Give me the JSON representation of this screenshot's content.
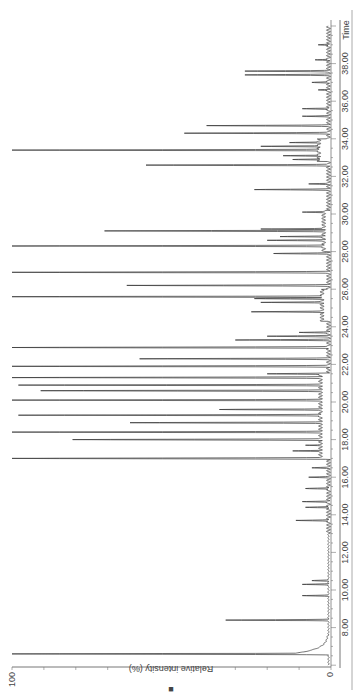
{
  "chart_data": {
    "type": "line",
    "subtype": "chromatogram",
    "orientation": "rotated-90-ccw",
    "title": "",
    "xlabel": "Time",
    "ylabel": "Relative intensity (%)",
    "xlim": [
      6.0,
      40.3
    ],
    "ylim": [
      0,
      100
    ],
    "x_ticks": [
      "8.00",
      "10.00",
      "12.00",
      "14.00",
      "16.00",
      "18.00",
      "20.00",
      "22.00",
      "24.00",
      "26.00",
      "28.00",
      "30.00",
      "32.00",
      "34.00",
      "36.00",
      "38.00"
    ],
    "y_ticks": [
      "0",
      "100"
    ],
    "grid": false,
    "legend": null,
    "marker_symbol": "■",
    "peaks": [
      {
        "t": 6.6,
        "i": 100
      },
      {
        "t": 8.4,
        "i": 33
      },
      {
        "t": 9.7,
        "i": 9
      },
      {
        "t": 10.3,
        "i": 9
      },
      {
        "t": 10.5,
        "i": 6
      },
      {
        "t": 13.7,
        "i": 11
      },
      {
        "t": 14.4,
        "i": 8
      },
      {
        "t": 14.7,
        "i": 9
      },
      {
        "t": 15.4,
        "i": 8
      },
      {
        "t": 16.0,
        "i": 7
      },
      {
        "t": 16.5,
        "i": 6
      },
      {
        "t": 17.0,
        "i": 100
      },
      {
        "t": 17.4,
        "i": 12
      },
      {
        "t": 17.7,
        "i": 8
      },
      {
        "t": 18.0,
        "i": 81
      },
      {
        "t": 18.4,
        "i": 100
      },
      {
        "t": 18.9,
        "i": 63
      },
      {
        "t": 19.3,
        "i": 98
      },
      {
        "t": 19.6,
        "i": 35
      },
      {
        "t": 20.1,
        "i": 100
      },
      {
        "t": 20.6,
        "i": 91
      },
      {
        "t": 20.9,
        "i": 98
      },
      {
        "t": 21.3,
        "i": 100
      },
      {
        "t": 21.5,
        "i": 20
      },
      {
        "t": 21.9,
        "i": 100
      },
      {
        "t": 22.3,
        "i": 60
      },
      {
        "t": 22.9,
        "i": 100
      },
      {
        "t": 23.3,
        "i": 30
      },
      {
        "t": 23.5,
        "i": 20
      },
      {
        "t": 23.7,
        "i": 10
      },
      {
        "t": 24.8,
        "i": 25
      },
      {
        "t": 25.3,
        "i": 22
      },
      {
        "t": 25.5,
        "i": 24
      },
      {
        "t": 25.6,
        "i": 100
      },
      {
        "t": 26.2,
        "i": 64
      },
      {
        "t": 26.9,
        "i": 100
      },
      {
        "t": 27.9,
        "i": 18
      },
      {
        "t": 28.3,
        "i": 100
      },
      {
        "t": 28.6,
        "i": 20
      },
      {
        "t": 28.8,
        "i": 16
      },
      {
        "t": 29.1,
        "i": 71
      },
      {
        "t": 29.2,
        "i": 22
      },
      {
        "t": 30.1,
        "i": 9
      },
      {
        "t": 31.3,
        "i": 24
      },
      {
        "t": 31.6,
        "i": 7
      },
      {
        "t": 32.6,
        "i": 58
      },
      {
        "t": 32.9,
        "i": 12
      },
      {
        "t": 33.1,
        "i": 15
      },
      {
        "t": 33.4,
        "i": 100
      },
      {
        "t": 33.6,
        "i": 22
      },
      {
        "t": 33.8,
        "i": 13
      },
      {
        "t": 34.3,
        "i": 46
      },
      {
        "t": 34.7,
        "i": 39
      },
      {
        "t": 35.2,
        "i": 9
      },
      {
        "t": 35.6,
        "i": 9
      },
      {
        "t": 36.6,
        "i": 4
      },
      {
        "t": 37.0,
        "i": 6
      },
      {
        "t": 37.4,
        "i": 27
      },
      {
        "t": 37.6,
        "i": 27
      },
      {
        "t": 38.2,
        "i": 5
      },
      {
        "t": 39.0,
        "i": 4
      }
    ]
  }
}
